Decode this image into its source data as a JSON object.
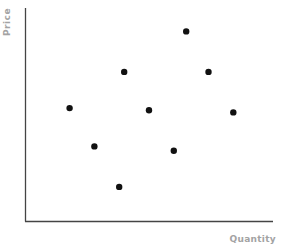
{
  "chart_data": {
    "type": "scatter",
    "title": "",
    "xlabel": "Quantity",
    "ylabel": "Price",
    "xlim": [
      0,
      100
    ],
    "ylim": [
      0,
      100
    ],
    "grid": false,
    "legend": null,
    "ticks": {
      "x": [],
      "y": []
    },
    "series": [
      {
        "name": "points",
        "color": "#111111",
        "points": [
          {
            "x": 18,
            "y": 53
          },
          {
            "x": 40,
            "y": 70
          },
          {
            "x": 65,
            "y": 89
          },
          {
            "x": 74,
            "y": 70
          },
          {
            "x": 50,
            "y": 52
          },
          {
            "x": 84,
            "y": 51
          },
          {
            "x": 28,
            "y": 35
          },
          {
            "x": 60,
            "y": 33
          },
          {
            "x": 38,
            "y": 16
          }
        ]
      }
    ]
  },
  "axes": {
    "color": "#444444",
    "label_color": "#a3a3a3"
  }
}
